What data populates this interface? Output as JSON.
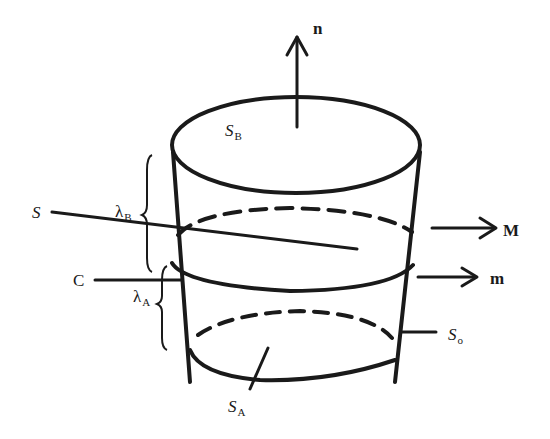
{
  "diagram": {
    "type": "truncated cone control volume",
    "stroke_color": "#1a1a1a",
    "labels": {
      "n": {
        "text": "n"
      },
      "S_B": {
        "base": "S",
        "sub": "B"
      },
      "S": {
        "text": "S"
      },
      "lambda_B": {
        "base": "λ",
        "sub": "B"
      },
      "C": {
        "text": "C"
      },
      "lambda_A": {
        "base": "λ",
        "sub": "A"
      },
      "M": {
        "text": "M"
      },
      "m": {
        "text": "m"
      },
      "S_o": {
        "base": "S",
        "sub": "o"
      },
      "S_A": {
        "base": "S",
        "sub": "A"
      }
    }
  }
}
